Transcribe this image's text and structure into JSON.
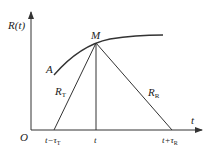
{
  "diagram": {
    "y_axis_label": "R(t)",
    "x_axis_label": "t",
    "origin_label": "O",
    "curve_label": "A",
    "point_label": "M",
    "left_segment_label": {
      "main": "R",
      "sub": "T"
    },
    "right_segment_label": {
      "main": "R",
      "sub": "R"
    },
    "tick_left": {
      "main": "t−τ",
      "sub": "T"
    },
    "tick_mid": "t",
    "tick_right": {
      "main": "t+τ",
      "sub": "R"
    },
    "line_color": "#333333"
  }
}
